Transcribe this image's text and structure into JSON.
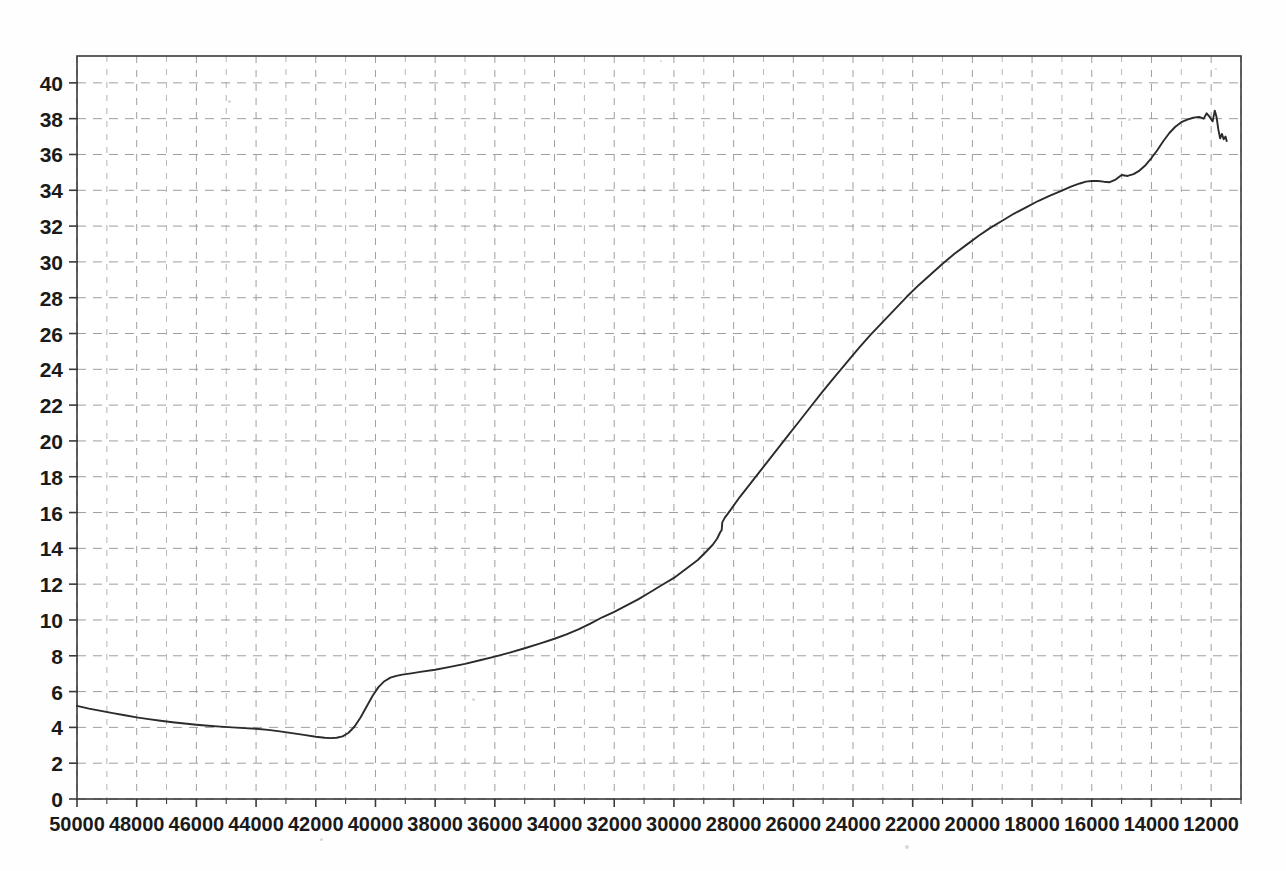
{
  "figure": {
    "background_color": "#fefefe",
    "frame_color": "#3a3a3a",
    "grid_color": "#9a9a9a",
    "curve_color": "#2b2b2b",
    "label_color": "#1a1a1a"
  },
  "chart_data": {
    "type": "line",
    "title": "",
    "subtitle": "",
    "xlabel": "",
    "ylabel": "",
    "xlim": [
      50000,
      11000
    ],
    "ylim": [
      0,
      41.5
    ],
    "x_axis_inverted": true,
    "grid": true,
    "grid_style": "dashed",
    "grid_minor_x_step": 1000,
    "grid_major_x_step": 2000,
    "grid_y_step": 2,
    "legend": null,
    "legend_position": "none",
    "y_ticks": [
      0,
      2,
      4,
      6,
      8,
      10,
      12,
      14,
      16,
      18,
      20,
      22,
      24,
      26,
      28,
      30,
      32,
      34,
      36,
      38,
      40
    ],
    "y_tick_labels": [
      "0",
      "2",
      "4",
      "6",
      "8",
      "10",
      "12",
      "14",
      "16",
      "18",
      "20",
      "22",
      "24",
      "26",
      "28",
      "30",
      "32",
      "34",
      "36",
      "38",
      "40"
    ],
    "x_ticks": [
      50000,
      48000,
      46000,
      44000,
      42000,
      40000,
      38000,
      36000,
      34000,
      32000,
      30000,
      28000,
      26000,
      24000,
      22000,
      20000,
      18000,
      16000,
      14000,
      12000
    ],
    "x_tick_labels": [
      "50000",
      "48000",
      "46000",
      "44000",
      "42000",
      "40000",
      "38000",
      "36000",
      "34000",
      "32000",
      "30000",
      "28000",
      "26000",
      "24000",
      "22000",
      "20000",
      "18000",
      "16000",
      "14000",
      "12000"
    ],
    "series": [
      {
        "name": "curve",
        "color": "#2b2b2b",
        "points": [
          [
            50000,
            5.2
          ],
          [
            49600,
            5.05
          ],
          [
            49200,
            4.92
          ],
          [
            48800,
            4.8
          ],
          [
            48400,
            4.68
          ],
          [
            48000,
            4.56
          ],
          [
            47600,
            4.46
          ],
          [
            47200,
            4.37
          ],
          [
            46800,
            4.29
          ],
          [
            46400,
            4.22
          ],
          [
            46000,
            4.15
          ],
          [
            45600,
            4.09
          ],
          [
            45200,
            4.04
          ],
          [
            44800,
            4.0
          ],
          [
            44400,
            3.96
          ],
          [
            44000,
            3.92
          ],
          [
            43600,
            3.86
          ],
          [
            43200,
            3.78
          ],
          [
            42800,
            3.68
          ],
          [
            42400,
            3.58
          ],
          [
            42000,
            3.48
          ],
          [
            41700,
            3.42
          ],
          [
            41500,
            3.4
          ],
          [
            41300,
            3.42
          ],
          [
            41100,
            3.5
          ],
          [
            40900,
            3.7
          ],
          [
            40700,
            4.05
          ],
          [
            40500,
            4.55
          ],
          [
            40300,
            5.15
          ],
          [
            40100,
            5.75
          ],
          [
            39900,
            6.25
          ],
          [
            39700,
            6.58
          ],
          [
            39500,
            6.78
          ],
          [
            39300,
            6.88
          ],
          [
            39100,
            6.95
          ],
          [
            38800,
            7.02
          ],
          [
            38500,
            7.1
          ],
          [
            38000,
            7.22
          ],
          [
            37500,
            7.38
          ],
          [
            37000,
            7.55
          ],
          [
            36500,
            7.75
          ],
          [
            36000,
            7.95
          ],
          [
            35500,
            8.18
          ],
          [
            35000,
            8.42
          ],
          [
            34500,
            8.68
          ],
          [
            34000,
            8.95
          ],
          [
            33600,
            9.2
          ],
          [
            33200,
            9.48
          ],
          [
            32800,
            9.8
          ],
          [
            32400,
            10.15
          ],
          [
            32000,
            10.45
          ],
          [
            31600,
            10.8
          ],
          [
            31200,
            11.15
          ],
          [
            30800,
            11.55
          ],
          [
            30400,
            11.95
          ],
          [
            30000,
            12.35
          ],
          [
            29600,
            12.85
          ],
          [
            29200,
            13.35
          ],
          [
            28900,
            13.85
          ],
          [
            28700,
            14.2
          ],
          [
            28550,
            14.55
          ],
          [
            28450,
            14.9
          ],
          [
            28400,
            15.02
          ],
          [
            28380,
            15.45
          ],
          [
            28300,
            15.7
          ],
          [
            28100,
            16.15
          ],
          [
            27800,
            16.85
          ],
          [
            27400,
            17.7
          ],
          [
            27000,
            18.55
          ],
          [
            26600,
            19.4
          ],
          [
            26200,
            20.25
          ],
          [
            25800,
            21.1
          ],
          [
            25400,
            21.95
          ],
          [
            25000,
            22.8
          ],
          [
            24600,
            23.6
          ],
          [
            24200,
            24.4
          ],
          [
            23800,
            25.2
          ],
          [
            23400,
            25.95
          ],
          [
            23000,
            26.65
          ],
          [
            22600,
            27.35
          ],
          [
            22200,
            28.05
          ],
          [
            21800,
            28.7
          ],
          [
            21400,
            29.3
          ],
          [
            21000,
            29.9
          ],
          [
            20600,
            30.45
          ],
          [
            20200,
            30.95
          ],
          [
            19800,
            31.45
          ],
          [
            19400,
            31.9
          ],
          [
            19000,
            32.3
          ],
          [
            18600,
            32.7
          ],
          [
            18200,
            33.05
          ],
          [
            17800,
            33.4
          ],
          [
            17400,
            33.7
          ],
          [
            17000,
            33.98
          ],
          [
            16700,
            34.2
          ],
          [
            16400,
            34.38
          ],
          [
            16200,
            34.48
          ],
          [
            16000,
            34.52
          ],
          [
            15800,
            34.52
          ],
          [
            15600,
            34.48
          ],
          [
            15400,
            34.45
          ],
          [
            15200,
            34.6
          ],
          [
            15000,
            34.85
          ],
          [
            14800,
            34.8
          ],
          [
            14600,
            34.9
          ],
          [
            14400,
            35.1
          ],
          [
            14200,
            35.4
          ],
          [
            14000,
            35.8
          ],
          [
            13800,
            36.25
          ],
          [
            13600,
            36.75
          ],
          [
            13400,
            37.2
          ],
          [
            13200,
            37.55
          ],
          [
            13000,
            37.8
          ],
          [
            12800,
            37.95
          ],
          [
            12600,
            38.05
          ],
          [
            12400,
            38.1
          ],
          [
            12250,
            38.0
          ],
          [
            12150,
            38.3
          ],
          [
            12050,
            38.1
          ],
          [
            11950,
            37.85
          ],
          [
            11880,
            38.45
          ],
          [
            11820,
            38.1
          ],
          [
            11760,
            37.4
          ],
          [
            11700,
            36.9
          ],
          [
            11640,
            37.15
          ],
          [
            11580,
            36.85
          ],
          [
            11520,
            37.0
          ],
          [
            11480,
            36.75
          ]
        ]
      }
    ]
  }
}
